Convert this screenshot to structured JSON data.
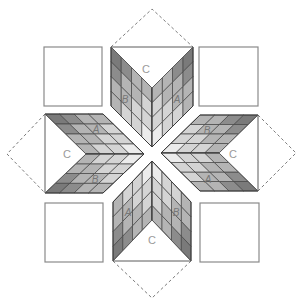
{
  "diagram": {
    "center": [
      152,
      152
    ],
    "grid_size": 4,
    "colors": {
      "line": "#444444",
      "dark": "#8c8c8c",
      "mid": "#b4b4b4",
      "light": "#d4d4d4",
      "pale": "#ececec"
    },
    "corner_squares": [
      {
        "name": "top-left",
        "x": 44,
        "y": 47,
        "w": 58,
        "h": 59
      },
      {
        "name": "top-right",
        "x": 199,
        "y": 47,
        "w": 59,
        "h": 59
      },
      {
        "name": "bottom-left",
        "x": 45,
        "y": 203,
        "w": 58,
        "h": 59
      },
      {
        "name": "bottom-right",
        "x": 200,
        "y": 203,
        "w": 59,
        "h": 59
      }
    ],
    "arms": [
      {
        "name": "top",
        "triangle_C": [
          [
            111,
            47
          ],
          [
            193,
            47
          ],
          [
            152,
            88
          ]
        ],
        "dashed": [
          [
            111,
            47
          ],
          [
            152,
            9
          ],
          [
            193,
            47
          ]
        ],
        "parallelograms": [
          {
            "piece": "B",
            "corners": [
              [
                111,
                47
              ],
              [
                152,
                88
              ],
              [
                152,
                147
              ],
              [
                111,
                106
              ]
            ]
          },
          {
            "piece": "A",
            "corners": [
              [
                193,
                47
              ],
              [
                152,
                88
              ],
              [
                152,
                147
              ],
              [
                193,
                106
              ]
            ]
          }
        ],
        "labels": [
          {
            "text": "C",
            "x": 146,
            "y": 70
          },
          {
            "text": "B",
            "x": 125,
            "y": 100
          },
          {
            "text": "A",
            "x": 177,
            "y": 100
          }
        ]
      },
      {
        "name": "bottom",
        "triangle_C": [
          [
            113,
            261
          ],
          [
            191,
            261
          ],
          [
            152,
            220
          ]
        ],
        "dashed": [
          [
            113,
            261
          ],
          [
            152,
            298
          ],
          [
            191,
            261
          ]
        ],
        "parallelograms": [
          {
            "piece": "A",
            "corners": [
              [
                113,
                261
              ],
              [
                152,
                220
              ],
              [
                152,
                161
              ],
              [
                113,
                202
              ]
            ]
          },
          {
            "piece": "B",
            "corners": [
              [
                191,
                261
              ],
              [
                152,
                220
              ],
              [
                152,
                161
              ],
              [
                191,
                202
              ]
            ]
          }
        ],
        "labels": [
          {
            "text": "A",
            "x": 128,
            "y": 213
          },
          {
            "text": "B",
            "x": 176,
            "y": 213
          },
          {
            "text": "C",
            "x": 152,
            "y": 241
          }
        ]
      },
      {
        "name": "left",
        "triangle_C": [
          [
            45,
            114
          ],
          [
            45,
            193
          ],
          [
            86,
            154
          ]
        ],
        "dashed": [
          [
            45,
            114
          ],
          [
            7,
            154
          ],
          [
            45,
            193
          ]
        ],
        "parallelograms": [
          {
            "piece": "A",
            "corners": [
              [
                45,
                114
              ],
              [
                86,
                154
              ],
              [
                144,
                154
              ],
              [
                103,
                114
              ]
            ]
          },
          {
            "piece": "B",
            "corners": [
              [
                45,
                193
              ],
              [
                86,
                154
              ],
              [
                144,
                154
              ],
              [
                103,
                193
              ]
            ]
          }
        ],
        "labels": [
          {
            "text": "A",
            "x": 96,
            "y": 130
          },
          {
            "text": "C",
            "x": 67,
            "y": 155
          },
          {
            "text": "B",
            "x": 95,
            "y": 180
          }
        ]
      },
      {
        "name": "right",
        "triangle_C": [
          [
            258,
            115
          ],
          [
            258,
            191
          ],
          [
            219,
            153
          ]
        ],
        "dashed": [
          [
            258,
            115
          ],
          [
            296,
            153
          ],
          [
            258,
            191
          ]
        ],
        "parallelograms": [
          {
            "piece": "B",
            "corners": [
              [
                258,
                115
              ],
              [
                219,
                153
              ],
              [
                161,
                153
              ],
              [
                200,
                115
              ]
            ]
          },
          {
            "piece": "A",
            "corners": [
              [
                258,
                191
              ],
              [
                219,
                153
              ],
              [
                161,
                153
              ],
              [
                200,
                191
              ]
            ]
          }
        ],
        "labels": [
          {
            "text": "B",
            "x": 207,
            "y": 131
          },
          {
            "text": "C",
            "x": 233,
            "y": 155
          },
          {
            "text": "A",
            "x": 208,
            "y": 180
          }
        ]
      }
    ]
  }
}
